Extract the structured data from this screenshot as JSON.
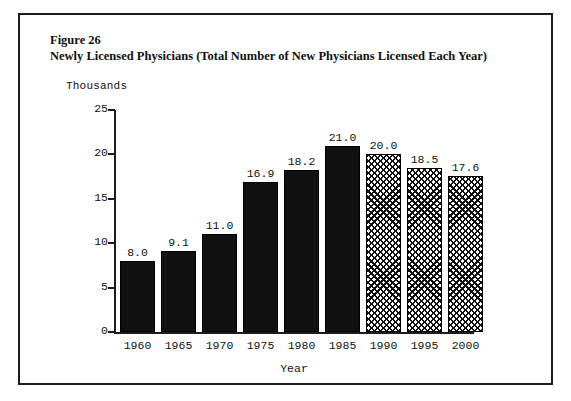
{
  "figure": {
    "label": "Figure 26",
    "title": "Newly Licensed Physicians (Total Number of New Physicians Licensed Each Year)"
  },
  "chart_data": {
    "type": "bar",
    "title": "Newly Licensed Physicians (Total Number of New Physicians Licensed Each Year)",
    "figure_label": "Figure 26",
    "xlabel": "Year",
    "ylabel": "Thousands",
    "units_label": "Thousands",
    "categories": [
      "1960",
      "1965",
      "1970",
      "1975",
      "1980",
      "1985",
      "1990",
      "1995",
      "2000"
    ],
    "values": [
      8.0,
      9.1,
      11.0,
      16.9,
      18.2,
      21.0,
      20.0,
      18.5,
      17.6
    ],
    "value_labels": [
      "8.0",
      "9.1",
      "11.0",
      "16.9",
      "18.2",
      "21.0",
      "20.0",
      "18.5",
      "17.6"
    ],
    "series": [
      {
        "name": "Newly Licensed Physicians",
        "values": [
          8.0,
          9.1,
          11.0,
          16.9,
          18.2,
          21.0,
          20.0,
          18.5,
          17.6
        ],
        "styles": [
          "solid",
          "solid",
          "solid",
          "solid",
          "solid",
          "solid",
          "hatched",
          "hatched",
          "hatched"
        ]
      }
    ],
    "ylim": [
      0,
      25
    ],
    "yticks": [
      0,
      5,
      10,
      15,
      20,
      25
    ],
    "ytick_labels": [
      "0",
      "5",
      "10",
      "15",
      "20",
      "25"
    ],
    "grid": false,
    "legend": false,
    "colors": {
      "bar_solid": "#111111",
      "bar_hatch_line": "#111111",
      "bar_hatch_background": "#ffffff",
      "axis": "#1c1c1c",
      "text": "#111111",
      "background": "#ffffff",
      "frame_border": "#1c1c1c"
    }
  }
}
